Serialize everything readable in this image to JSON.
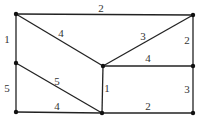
{
  "graph": {
    "nodes": [
      {
        "id": "A",
        "x": 16,
        "y": 14
      },
      {
        "id": "B",
        "x": 193,
        "y": 15
      },
      {
        "id": "C",
        "x": 16,
        "y": 63
      },
      {
        "id": "D",
        "x": 103,
        "y": 66
      },
      {
        "id": "E",
        "x": 193,
        "y": 66
      },
      {
        "id": "F",
        "x": 16,
        "y": 112
      },
      {
        "id": "G",
        "x": 102,
        "y": 113
      },
      {
        "id": "H",
        "x": 193,
        "y": 113
      }
    ],
    "edges": [
      {
        "from": "A",
        "to": "B",
        "weight": "2",
        "lx": 101,
        "ly": 12
      },
      {
        "from": "A",
        "to": "C",
        "weight": "1",
        "lx": 7,
        "ly": 43
      },
      {
        "from": "A",
        "to": "D",
        "weight": "4",
        "lx": 61,
        "ly": 37
      },
      {
        "from": "B",
        "to": "D",
        "weight": "3",
        "lx": 143,
        "ly": 40
      },
      {
        "from": "B",
        "to": "E",
        "weight": "2",
        "lx": 187,
        "ly": 44
      },
      {
        "from": "C",
        "to": "F",
        "weight": "5",
        "lx": 7,
        "ly": 92
      },
      {
        "from": "C",
        "to": "G",
        "weight": "5",
        "lx": 57,
        "ly": 85
      },
      {
        "from": "D",
        "to": "E",
        "weight": "4",
        "lx": 148,
        "ly": 62
      },
      {
        "from": "D",
        "to": "G",
        "weight": "1",
        "lx": 107,
        "ly": 92
      },
      {
        "from": "E",
        "to": "H",
        "weight": "3",
        "lx": 187,
        "ly": 93
      },
      {
        "from": "F",
        "to": "G",
        "weight": "4",
        "lx": 57,
        "ly": 110
      },
      {
        "from": "G",
        "to": "H",
        "weight": "2",
        "lx": 148,
        "ly": 110
      }
    ]
  }
}
